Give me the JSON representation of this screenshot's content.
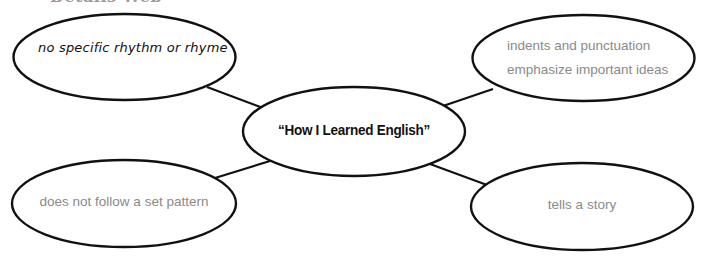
{
  "header": {
    "title": "Details Web"
  },
  "diagram": {
    "type": "web",
    "center": {
      "label": "“How I Learned English”"
    },
    "nodes": [
      {
        "id": "top-left",
        "lines": [
          "no specific rhythm or rhyme"
        ]
      },
      {
        "id": "top-right",
        "lines": [
          "indents and punctuation",
          "emphasize important ideas"
        ]
      },
      {
        "id": "bottom-left",
        "lines": [
          "does not follow a set pattern"
        ]
      },
      {
        "id": "bottom-right",
        "lines": [
          "tells a story"
        ]
      }
    ]
  },
  "colors": {
    "stroke": "#111111",
    "handwritten_text": "#111111",
    "typed_text": "#8a8a8a",
    "header_text": "#9a9a9a",
    "background": "#ffffff"
  }
}
